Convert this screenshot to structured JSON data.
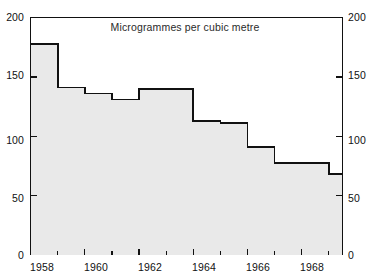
{
  "chart_data": {
    "type": "area",
    "title": "Microgrammes per cubic metre",
    "xlabel": "",
    "ylabel": "",
    "xlim": [
      1958,
      1969.5
    ],
    "ylim": [
      0,
      200
    ],
    "grid": false,
    "legend": "none",
    "step_style": "post",
    "y_ticks_major": [
      0,
      50,
      100,
      150,
      200
    ],
    "y_tick_labels_left": [
      "0",
      "50",
      "100",
      "150",
      "200"
    ],
    "y_tick_labels_right": [
      "0",
      "50",
      "100",
      "150",
      "200"
    ],
    "x_ticks_major": [
      1958,
      1960,
      1962,
      1964,
      1966,
      1968
    ],
    "x_tick_labels": [
      "1958",
      "1960",
      "1962",
      "1964",
      "1966",
      "1968"
    ],
    "x_ticks_minor": [
      1959,
      1961,
      1963,
      1965,
      1967,
      1969
    ],
    "categories": [
      1958,
      1959,
      1960,
      1961,
      1962,
      1963,
      1964,
      1965,
      1966,
      1967,
      1968,
      1969
    ],
    "values": [
      178,
      141,
      136,
      131,
      140,
      140,
      113,
      111,
      91,
      77,
      77,
      68
    ],
    "series": [
      {
        "name": "Smoke concentration",
        "values": [
          178,
          141,
          136,
          131,
          140,
          140,
          113,
          111,
          91,
          77,
          77,
          68
        ]
      }
    ],
    "colors": {
      "fill": "#e9e9e9",
      "line": "#111111",
      "axis": "#111111",
      "text": "#111111"
    }
  },
  "axes": {
    "left_labels": [
      {
        "text": "200",
        "value": 200
      },
      {
        "text": "150",
        "value": 150
      },
      {
        "text": "100",
        "value": 100
      },
      {
        "text": "50",
        "value": 50
      },
      {
        "text": "0",
        "value": 0
      }
    ],
    "right_labels": [
      {
        "text": "200",
        "value": 200
      },
      {
        "text": "150",
        "value": 150
      },
      {
        "text": "100",
        "value": 100
      },
      {
        "text": "50",
        "value": 50
      },
      {
        "text": "0",
        "value": 0
      }
    ],
    "x_labels": [
      {
        "text": "1958",
        "value": 1958
      },
      {
        "text": "1960",
        "value": 1960
      },
      {
        "text": "1962",
        "value": 1962
      },
      {
        "text": "1964",
        "value": 1964
      },
      {
        "text": "1966",
        "value": 1966
      },
      {
        "text": "1968",
        "value": 1968
      }
    ]
  }
}
